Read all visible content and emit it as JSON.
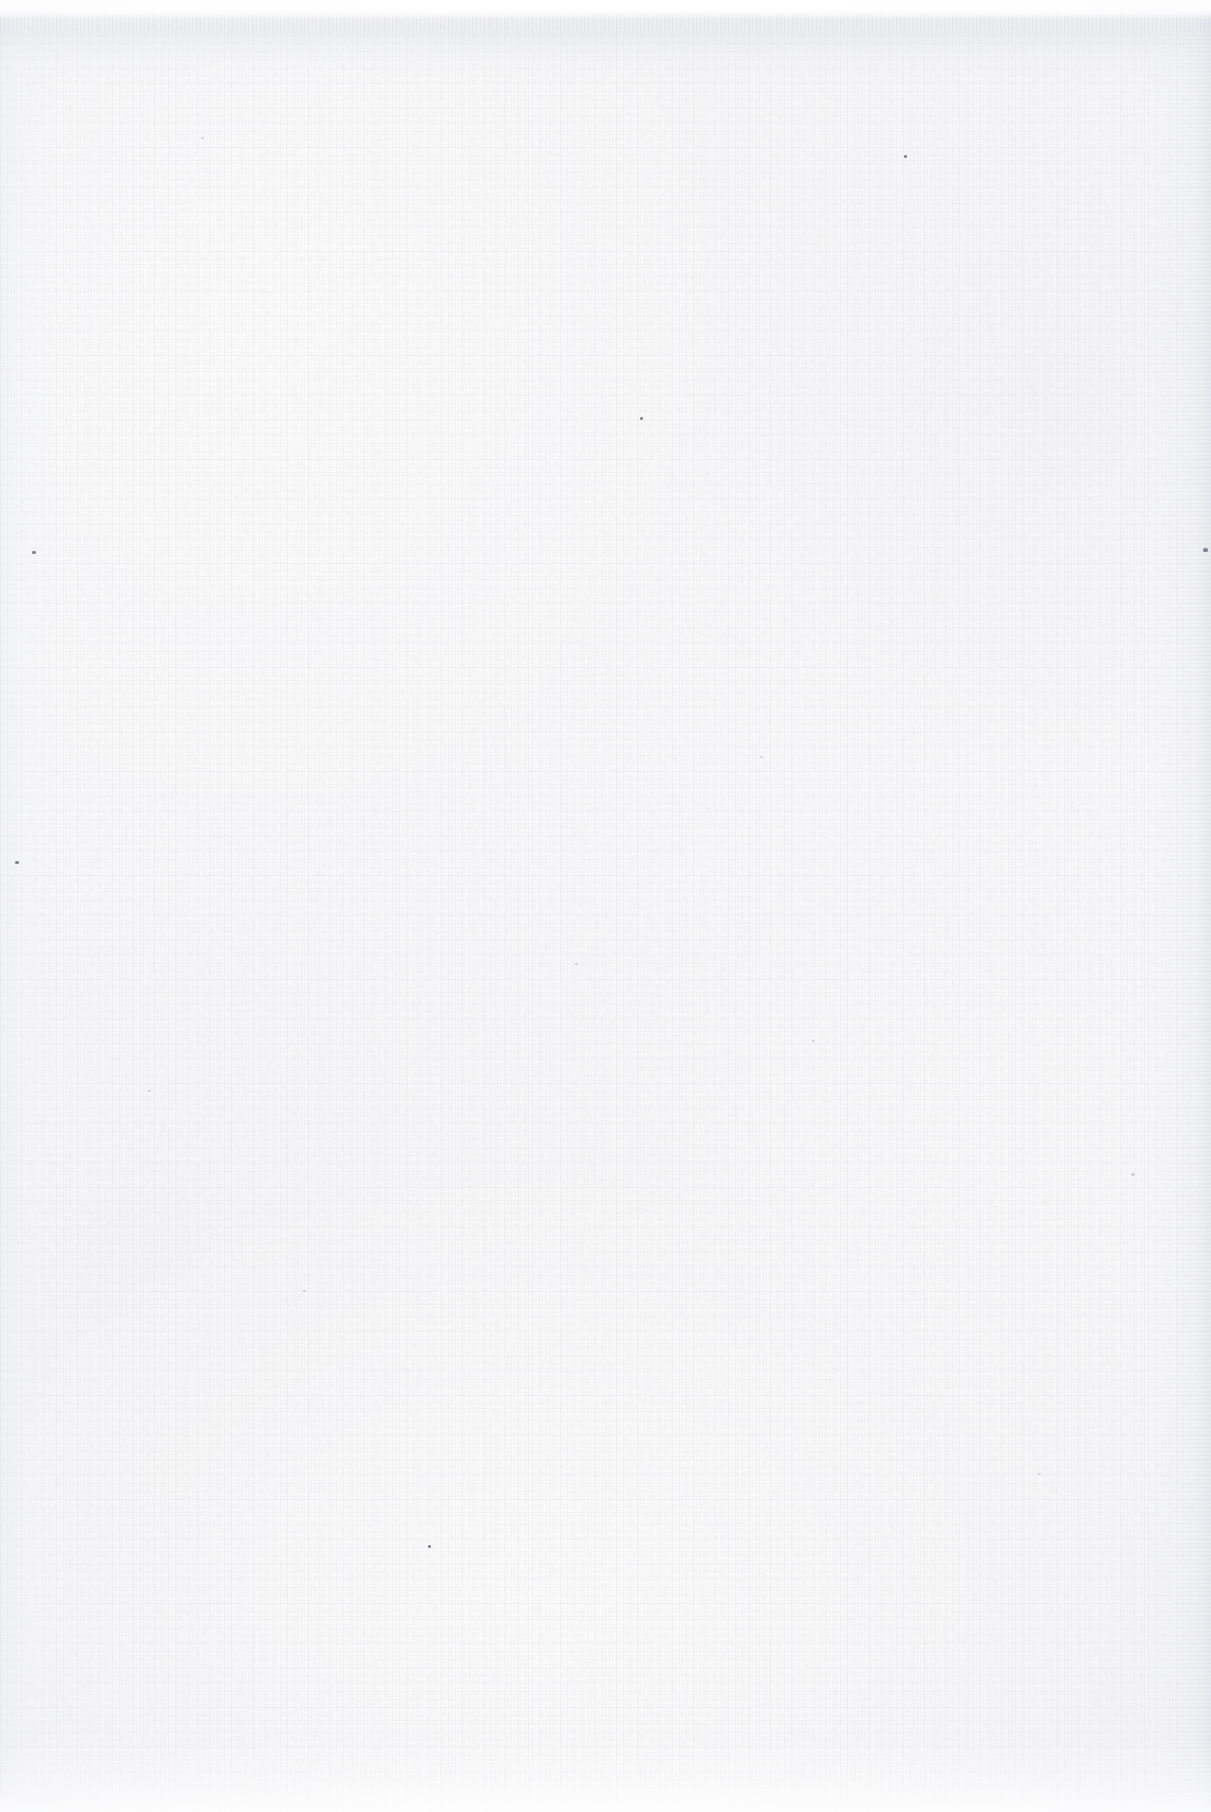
{
  "page": {
    "kind": "scanned-blank-page",
    "width_px": 1211,
    "height_px": 1812,
    "text_content": "",
    "visible_labels": []
  },
  "appearance": {
    "base_color": "#fafafb",
    "highlight_color": "#ffffff",
    "shadow_color": "#e2e4ec",
    "fiber_color": "#b4b6c0",
    "fleck_color": "#6f717d",
    "surface": "woven laid paper",
    "edges": {
      "top": "denser darker fiber band with deckle fade",
      "bottom": "soft fade to white at sheet edge",
      "right": "gutter / page-curl shading band",
      "left": "very light shading band"
    }
  },
  "flecks": [
    {
      "x": 1203,
      "y": 548,
      "w": 5,
      "h": 4,
      "soft": false
    },
    {
      "x": 32,
      "y": 551,
      "w": 4,
      "h": 3,
      "soft": false
    },
    {
      "x": 15,
      "y": 861,
      "w": 4,
      "h": 3,
      "soft": false
    },
    {
      "x": 904,
      "y": 155,
      "w": 3,
      "h": 3,
      "soft": false
    },
    {
      "x": 640,
      "y": 417,
      "w": 3,
      "h": 3,
      "soft": false
    },
    {
      "x": 428,
      "y": 1545,
      "w": 3,
      "h": 3,
      "soft": false
    },
    {
      "x": 201,
      "y": 137,
      "w": 3,
      "h": 2,
      "soft": true
    },
    {
      "x": 1131,
      "y": 1173,
      "w": 4,
      "h": 3,
      "soft": true
    },
    {
      "x": 148,
      "y": 1090,
      "w": 3,
      "h": 2,
      "soft": true
    },
    {
      "x": 812,
      "y": 1040,
      "w": 3,
      "h": 2,
      "soft": true
    },
    {
      "x": 760,
      "y": 756,
      "w": 3,
      "h": 2,
      "soft": true
    },
    {
      "x": 303,
      "y": 1290,
      "w": 3,
      "h": 2,
      "soft": true
    },
    {
      "x": 1038,
      "y": 1473,
      "w": 3,
      "h": 2,
      "soft": true
    },
    {
      "x": 575,
      "y": 963,
      "w": 3,
      "h": 2,
      "soft": true
    }
  ]
}
